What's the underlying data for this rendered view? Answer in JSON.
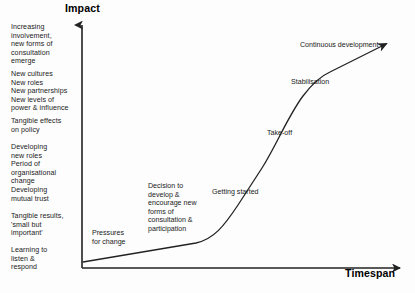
{
  "axes": {
    "y_title": "Impact",
    "x_title": "Timespan"
  },
  "impact_descriptions": [
    {
      "id": "increasing",
      "text": "Increasing\ninvolvement,\nnew forms of\nconsultation\nemerge"
    },
    {
      "id": "cultures",
      "text": "New cultures\nNew roles\nNew partnerships\nNew levels of\npower & influence"
    },
    {
      "id": "tangible-policy",
      "text": "Tangible effects\non policy"
    },
    {
      "id": "developing-roles",
      "text": "Developing\nnew roles\nPeriod of\norganisational\nchange"
    },
    {
      "id": "mutual-trust",
      "text": "Developing\nmutual trust"
    },
    {
      "id": "tangible-results",
      "text": "Tangible results,\n'small but\nimportant'"
    },
    {
      "id": "learning",
      "text": "Learning to\nlisten &\nrespond"
    }
  ],
  "curve_stages": [
    {
      "id": "pressures",
      "label": "Pressures\nfor change"
    },
    {
      "id": "decision",
      "label": "Decision to\ndevelop &\nencourage new\nforms of\nconsultation &\nparticipation"
    },
    {
      "id": "getting-started",
      "label": "Getting started"
    },
    {
      "id": "take-off",
      "label": "Take-off"
    },
    {
      "id": "stabilisation",
      "label": "Stabilisation"
    },
    {
      "id": "continuous",
      "label": "Continuous development"
    }
  ],
  "colors": {
    "line": "#222222",
    "text": "#1a1a1a",
    "background": "#fdfdfd"
  }
}
